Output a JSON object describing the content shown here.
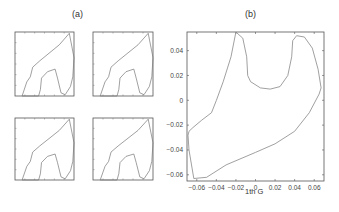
{
  "chart_data": [
    {
      "type": "line",
      "panel": "(a)",
      "title": "(a)",
      "subplots": 4,
      "description": "2x2 grid of small closed-curve plots, no tick labels",
      "shape_points_normalized": [
        [
          0.12,
          1.0
        ],
        [
          0.2,
          0.78
        ],
        [
          0.26,
          0.7
        ],
        [
          0.3,
          0.55
        ],
        [
          0.42,
          0.45
        ],
        [
          0.75,
          0.2
        ],
        [
          0.92,
          0.02
        ],
        [
          1.0,
          0.4
        ],
        [
          0.98,
          0.7
        ],
        [
          0.94,
          0.85
        ],
        [
          0.85,
          0.98
        ],
        [
          0.78,
          0.95
        ],
        [
          0.72,
          0.72
        ],
        [
          0.68,
          0.58
        ],
        [
          0.55,
          0.62
        ],
        [
          0.45,
          0.72
        ],
        [
          0.43,
          0.9
        ],
        [
          0.4,
          1.0
        ]
      ]
    },
    {
      "type": "line",
      "panel": "(b)",
      "title": "(b)",
      "xlabel": "1th G",
      "ylabel": "",
      "xlim": [
        -0.07,
        0.07
      ],
      "ylim": [
        -0.065,
        0.055
      ],
      "xticks": [
        "-0.06",
        "-0.04",
        "-0.02",
        "0",
        "0.02",
        "0.04",
        "0.06"
      ],
      "yticks": [
        "0.04",
        "0.02",
        "0",
        "-0.02",
        "-0.04",
        "-0.06"
      ],
      "grid": false,
      "series": [
        {
          "name": "closed curve",
          "x": [
            -0.02,
            -0.013,
            -0.009,
            -0.008,
            -0.005,
            0.005,
            0.015,
            0.025,
            0.033,
            0.037,
            0.038,
            0.042,
            0.05,
            0.058,
            0.064,
            0.067,
            0.065,
            0.055,
            0.04,
            0.02,
            0.0,
            -0.03,
            -0.05,
            -0.063,
            -0.068,
            -0.069,
            -0.068,
            -0.064,
            -0.055,
            -0.045,
            -0.04,
            -0.033,
            -0.025,
            -0.02
          ],
          "y": [
            0.055,
            0.05,
            0.035,
            0.02,
            0.015,
            0.01,
            0.009,
            0.011,
            0.02,
            0.035,
            0.048,
            0.052,
            0.051,
            0.042,
            0.025,
            0.01,
            0.005,
            -0.01,
            -0.025,
            -0.035,
            -0.042,
            -0.052,
            -0.062,
            -0.063,
            -0.04,
            -0.028,
            -0.025,
            -0.022,
            -0.016,
            -0.01,
            0.0,
            0.015,
            0.035,
            0.055
          ]
        }
      ]
    }
  ],
  "labels": {
    "a": "(a)",
    "b": "(b)",
    "xlabel": "1th G"
  }
}
